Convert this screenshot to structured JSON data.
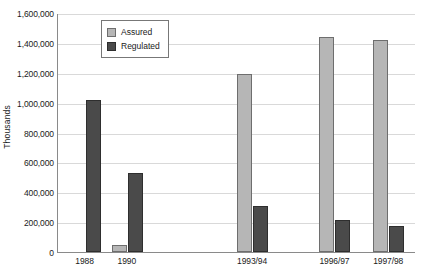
{
  "chart_data": {
    "type": "bar",
    "title": "",
    "subtitle": "",
    "xlabel": "",
    "ylabel": "Thousands",
    "ylim": [
      0,
      1600000
    ],
    "ytick_step": 200000,
    "ytick_labels": [
      "0",
      "200,000",
      "400,000",
      "600,000",
      "800,000",
      "1,000,000",
      "1,200,000",
      "1,400,000",
      "1,600,000"
    ],
    "ytick_values": [
      0,
      200000,
      400000,
      600000,
      800000,
      1000000,
      1200000,
      1400000,
      1600000
    ],
    "grid": true,
    "grid_axis": "y",
    "legend_position": "top-left-inside",
    "categories": [
      "1988",
      "1990",
      "1993/94",
      "1996/97",
      "1997/98"
    ],
    "series": [
      {
        "name": "Assured",
        "color": "#b6b6b6",
        "values": [
          0,
          50000,
          1190000,
          1440000,
          1420000
        ]
      },
      {
        "name": "Regulated",
        "color": "#4a4a4a",
        "values": [
          1020000,
          530000,
          305000,
          215000,
          175000
        ]
      }
    ]
  },
  "legend": {
    "entries": [
      {
        "label": "Assured",
        "swatch": "assured"
      },
      {
        "label": "Regulated",
        "swatch": "regulated"
      }
    ]
  }
}
